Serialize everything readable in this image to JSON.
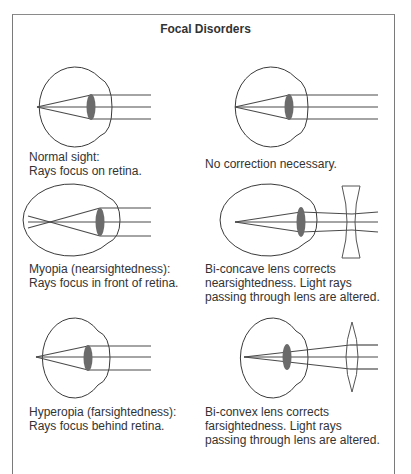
{
  "title": "Focal Disorders",
  "panels": [
    {
      "id": "normal",
      "caption_lines": [
        "Normal sight:",
        "Rays focus on retina."
      ],
      "correction_lines": [
        "No correction necessary."
      ]
    },
    {
      "id": "myopia",
      "caption_lines": [
        "Myopia (nearsightedness):",
        "Rays focus in front of retina."
      ],
      "correction_lines": [
        "Bi-concave lens corrects",
        "nearsightedness. Light rays",
        "passing through lens are altered."
      ]
    },
    {
      "id": "hyperopia",
      "caption_lines": [
        "Hyperopia (farsightedness):",
        "Rays focus behind retina."
      ],
      "correction_lines": [
        "Bi-convex lens corrects",
        "farsightedness. Light rays",
        "passing through lens are altered."
      ]
    }
  ],
  "colors": {
    "outline": "#3a3a3a",
    "ray": "#4a4a4a",
    "lens_fill": "#6b6b6b",
    "frame": "#7a7a7a"
  }
}
